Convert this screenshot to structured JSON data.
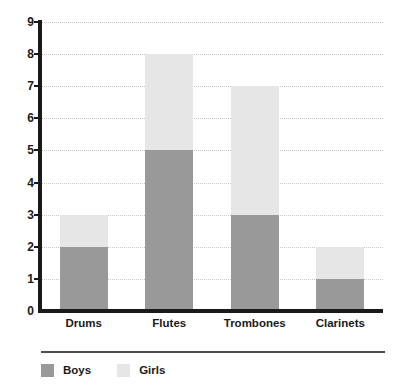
{
  "chart_data": {
    "type": "bar",
    "stacked": true,
    "title": "",
    "subtitle": "",
    "xlabel": "",
    "ylabel": "",
    "categories": [
      "Drums",
      "Flutes",
      "Trombones",
      "Clarinets"
    ],
    "series": [
      {
        "name": "Boys",
        "values": [
          2,
          5,
          3,
          1
        ],
        "color": "#999999"
      },
      {
        "name": "Girls",
        "values": [
          1,
          3,
          4,
          1
        ],
        "color": "#e6e6e6"
      }
    ],
    "totals": [
      3,
      8,
      7,
      2
    ],
    "ylim": [
      0,
      9
    ],
    "y_ticks": [
      0,
      1,
      2,
      3,
      4,
      5,
      6,
      7,
      8,
      9
    ],
    "y_tick_labels": [
      "0",
      "1",
      "2",
      "3",
      "4",
      "5",
      "6",
      "7",
      "8",
      "9"
    ],
    "grid": true,
    "grid_style": "dotted",
    "grid_color": "#c9c9c9",
    "legend_position": "bottom-left",
    "axis_color": "#1a1a1a",
    "background": "#ffffff"
  },
  "legend": {
    "entries": [
      {
        "label": "Boys",
        "color": "#999999"
      },
      {
        "label": "Girls",
        "color": "#e6e6e6"
      }
    ]
  }
}
